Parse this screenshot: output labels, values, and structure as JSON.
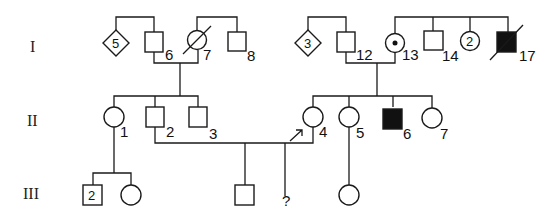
{
  "diagram": {
    "type": "pedigree",
    "generations": [
      {
        "label": "I"
      },
      {
        "label": "II"
      },
      {
        "label": "III"
      }
    ],
    "gen_labels": {
      "g1": "I",
      "g2": "II",
      "g3": "III"
    },
    "individuals": {
      "I5": {
        "shape": "diamond",
        "inner": "5",
        "label": ""
      },
      "I6": {
        "shape": "square",
        "label": "6"
      },
      "I7": {
        "shape": "circle",
        "deceased": true,
        "label": "7"
      },
      "I8": {
        "shape": "square",
        "label": "8"
      },
      "I3": {
        "shape": "diamond",
        "inner": "3",
        "label": ""
      },
      "I12": {
        "shape": "square",
        "label": "12"
      },
      "I13": {
        "shape": "circle",
        "carrier_dot": true,
        "label": "13"
      },
      "I14": {
        "shape": "square",
        "label": "14"
      },
      "I2c": {
        "shape": "circle",
        "inner": "2",
        "label": ""
      },
      "I17": {
        "shape": "square",
        "affected": true,
        "deceased": true,
        "label": "17"
      },
      "II1": {
        "shape": "circle",
        "label": "1"
      },
      "II2": {
        "shape": "square",
        "label": "2"
      },
      "II3": {
        "shape": "square",
        "label": "3"
      },
      "II4": {
        "shape": "circle",
        "proband": true,
        "label": "4"
      },
      "II5": {
        "shape": "circle",
        "label": "5"
      },
      "II6": {
        "shape": "square",
        "affected": true,
        "label": "6"
      },
      "II7": {
        "shape": "circle",
        "label": "7"
      },
      "III2s": {
        "shape": "square",
        "inner": "2",
        "label": ""
      },
      "IIIc1": {
        "shape": "circle",
        "label": ""
      },
      "IIIs": {
        "shape": "square",
        "label": ""
      },
      "IIIq": {
        "shape": "unknown",
        "label": "?"
      },
      "IIIc2": {
        "shape": "circle",
        "label": ""
      }
    }
  }
}
